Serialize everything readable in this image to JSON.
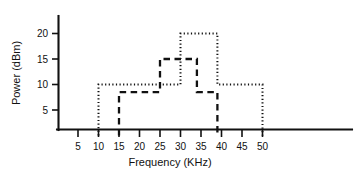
{
  "chart_data": {
    "type": "line",
    "title": "",
    "subtitle": "",
    "xlabel": "Frequency (KHz)",
    "ylabel": "Power (dBm)",
    "xlim": [
      0,
      53
    ],
    "ylim": [
      0,
      23
    ],
    "xticks": [
      5,
      10,
      15,
      20,
      25,
      30,
      35,
      40,
      45,
      50
    ],
    "xtick_labels": [
      "5",
      "10",
      "15",
      "20",
      "25",
      "30",
      "35",
      "40",
      "45",
      "50"
    ],
    "yticks": [
      5,
      10,
      15,
      20
    ],
    "ytick_labels": [
      "5",
      "10",
      "15",
      "20"
    ],
    "grid": false,
    "legend": "none",
    "style": "step",
    "series": [
      {
        "name": "dotted-spectrum",
        "line_style": "dotted",
        "color": "#111111",
        "x": [
          10,
          10,
          30,
          30,
          39,
          39,
          50,
          50
        ],
        "y": [
          0,
          10,
          10,
          20,
          20,
          10,
          10,
          0
        ],
        "steps": [
          {
            "from": 10,
            "to": 30,
            "power": 10
          },
          {
            "from": 30,
            "to": 39,
            "power": 20
          },
          {
            "from": 39,
            "to": 50,
            "power": 10
          }
        ]
      },
      {
        "name": "dashed-spectrum",
        "line_style": "dashed",
        "color": "#111111",
        "x": [
          15,
          15,
          25,
          25,
          34,
          34,
          39,
          39
        ],
        "y": [
          0,
          8.5,
          8.5,
          15,
          15,
          8.5,
          8.5,
          0
        ],
        "steps": [
          {
            "from": 15,
            "to": 25,
            "power": 8.5
          },
          {
            "from": 25,
            "to": 34,
            "power": 15
          },
          {
            "from": 34,
            "to": 39,
            "power": 8.5
          }
        ]
      }
    ]
  },
  "axes": {
    "x_axis_name": "frequency-axis",
    "y_axis_name": "power-axis",
    "x_unit": "KHz",
    "y_unit": "dBm"
  },
  "geometry": {
    "origin_x_px": 58,
    "baseline_y_px": 130,
    "x_px_per_unit": 4.1,
    "x_zero_px": 57.5,
    "y_px_per_unit": 5.1,
    "y_zero_px": 135.5
  }
}
